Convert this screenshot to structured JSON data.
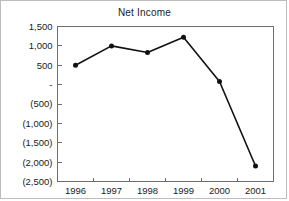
{
  "chart_data": {
    "type": "line",
    "title": "Net Income",
    "xlabel": "",
    "ylabel": "",
    "categories": [
      "1996",
      "1997",
      "1998",
      "1999",
      "2000",
      "2001"
    ],
    "values": [
      500,
      1000,
      830,
      1220,
      80,
      -2100
    ],
    "series": [
      {
        "name": "Net Income",
        "values": [
          500,
          1000,
          830,
          1220,
          80,
          -2100
        ]
      }
    ],
    "ylim": [
      -2500,
      1500
    ],
    "y_ticks": [
      1500,
      1000,
      500,
      0,
      -500,
      -1000,
      -1500,
      -2000,
      -2500
    ],
    "y_tick_labels": [
      "1,500",
      "1,000",
      "500",
      "-",
      "(500)",
      "(1,000)",
      "(1,500)",
      "(2,000)",
      "(2,500)"
    ],
    "x_tick_labels": [
      "1996",
      "1997",
      "1998",
      "1999",
      "2000",
      "2001"
    ],
    "grid": false,
    "legend": false,
    "marker": "filled-circle",
    "line_color": "#111111",
    "marker_color": "#111111",
    "axis_color": "#6e6e6e",
    "background_color": "#ffffff",
    "border_color": "#bdbdbd"
  },
  "chart": {
    "title": "Net Income"
  }
}
